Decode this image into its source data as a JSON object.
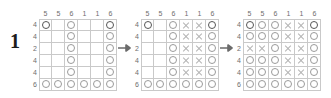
{
  "step": {
    "label": "1"
  },
  "arrow": {
    "icon": "arrow-right-icon",
    "count": 2
  },
  "puzzle": {
    "rows": 6,
    "cols": 6,
    "column_clues": [
      "5",
      "5",
      "6",
      "1",
      "1",
      "6"
    ],
    "row_clues": [
      "4",
      "4",
      "2",
      "4",
      "4",
      "6"
    ],
    "mark_glyphs": {
      "filled": "O",
      "blocked": "X",
      "empty": ""
    },
    "colors": {
      "grid_line": "#c9c9c9",
      "mark_filled": "#9a9a9a",
      "mark_filled_strong": "#555555",
      "mark_blocked": "#b4b4b4",
      "clue_text": "#6e6e6e",
      "step_text": "#1c1c1c"
    }
  },
  "panels": [
    {
      "name": "grid-state-initial",
      "cells": [
        [
          "O*",
          "",
          "O",
          "",
          "",
          "O*"
        ],
        [
          "",
          "",
          "O",
          "",
          "",
          "O"
        ],
        [
          "",
          "",
          "O",
          "",
          "",
          "O"
        ],
        [
          "",
          "",
          "O",
          "",
          "",
          "O"
        ],
        [
          "",
          "",
          "O",
          "",
          "",
          "O"
        ],
        [
          "O",
          "O",
          "O",
          "O",
          "O",
          "O"
        ]
      ]
    },
    {
      "name": "grid-state-middle",
      "cells": [
        [
          "O*",
          "",
          "O",
          "X",
          "X",
          "O*"
        ],
        [
          "",
          "",
          "O",
          "X",
          "X",
          "O"
        ],
        [
          "",
          "",
          "O",
          "X",
          "X",
          "O"
        ],
        [
          "",
          "",
          "O",
          "X",
          "X",
          "O"
        ],
        [
          "",
          "",
          "O",
          "X",
          "X",
          "O"
        ],
        [
          "O",
          "O",
          "O",
          "O",
          "O",
          "O"
        ]
      ]
    },
    {
      "name": "grid-state-final",
      "cells": [
        [
          "O*",
          "O",
          "O",
          "X",
          "X",
          "O*"
        ],
        [
          "O",
          "O",
          "O",
          "X",
          "X",
          "O"
        ],
        [
          "X",
          "X",
          "O",
          "X",
          "X",
          "O"
        ],
        [
          "O",
          "O",
          "O",
          "X",
          "X",
          "O"
        ],
        [
          "O",
          "O",
          "O",
          "X",
          "X",
          "O"
        ],
        [
          "O",
          "O",
          "O",
          "O",
          "O",
          "O"
        ]
      ]
    }
  ]
}
